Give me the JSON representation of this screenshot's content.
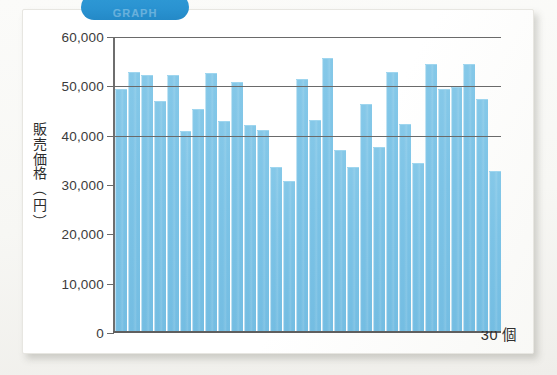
{
  "section_tab": {
    "label": "GRAPH"
  },
  "chart_data": {
    "type": "bar",
    "title": "",
    "subtitle": "",
    "xlabel": "30 個",
    "ylabel": "販売価格（円）",
    "ylabel_chars": [
      "販",
      "売",
      "価",
      "格"
    ],
    "ylabel_unit_open": "（",
    "ylabel_unit": "円",
    "ylabel_unit_close": "）",
    "ylim": [
      0,
      60000
    ],
    "ytick_labels": [
      "60,000",
      "50,000",
      "40,000",
      "30,000",
      "20,000",
      "10,000",
      "0"
    ],
    "ytick_values": [
      60000,
      50000,
      40000,
      30000,
      20000,
      10000,
      0
    ],
    "gridlines_at": [
      60000,
      50000,
      40000
    ],
    "grid": true,
    "legend": "none",
    "n": 30,
    "categories": [
      "1",
      "2",
      "3",
      "4",
      "5",
      "6",
      "7",
      "8",
      "9",
      "10",
      "11",
      "12",
      "13",
      "14",
      "15",
      "16",
      "17",
      "18",
      "19",
      "20",
      "21",
      "22",
      "23",
      "24",
      "25",
      "26",
      "27",
      "28",
      "29",
      "30"
    ],
    "values": [
      49000,
      52500,
      51800,
      46600,
      51800,
      40500,
      45000,
      52300,
      42500,
      50400,
      41800,
      40700,
      33200,
      30500,
      51000,
      42700,
      55300,
      36700,
      33300,
      46100,
      37200,
      52600,
      42000,
      34000,
      54200,
      49000,
      49400,
      54200,
      47000,
      32400
    ],
    "bar_color": "#7cc3e6",
    "axis_color": "#6a6a6a",
    "text_color": "#333333"
  }
}
